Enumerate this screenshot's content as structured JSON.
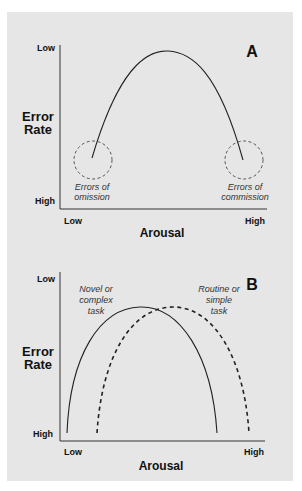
{
  "panels": [
    {
      "letter": "A",
      "y_axis": {
        "title_line1": "Error",
        "title_line2": "Rate",
        "top_tick": "Low",
        "bottom_tick": "High"
      },
      "x_axis": {
        "title": "Arousal",
        "left_tick": "Low",
        "right_tick": "High"
      },
      "annotations": [
        {
          "line1": "Errors of",
          "line2": "omission"
        },
        {
          "line1": "Errors of",
          "line2": "commission"
        }
      ]
    },
    {
      "letter": "B",
      "y_axis": {
        "title_line1": "Error",
        "title_line2": "Rate",
        "top_tick": "Low",
        "bottom_tick": "High"
      },
      "x_axis": {
        "title": "Arousal",
        "left_tick": "Low",
        "right_tick": "High"
      },
      "annotations": [
        {
          "line1": "Novel or",
          "line2": "complex",
          "line3": "task"
        },
        {
          "line1": "Routine or",
          "line2": "simple",
          "line3": "task"
        }
      ]
    }
  ],
  "colors": {
    "panel_bg": "#e6e6e6",
    "line": "#222222",
    "circle": "#555555"
  }
}
